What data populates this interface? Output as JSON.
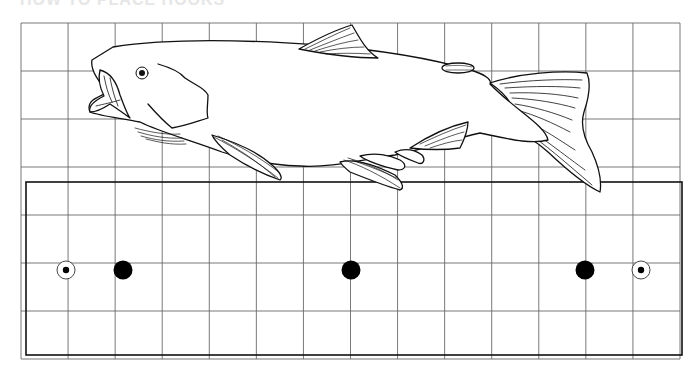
{
  "header": {
    "title": "HOW TO PLACE HOOKS"
  },
  "diagram": {
    "grid": {
      "columns": 14,
      "rows": 7
    },
    "subjects": [
      {
        "name": "fish",
        "parts": [
          "head",
          "eye",
          "mouth",
          "gill-cover",
          "dorsal-fin",
          "adipose-fin",
          "caudal-fin",
          "pectoral-fin",
          "pelvic-fin",
          "anal-fin"
        ]
      },
      {
        "name": "mounting-board"
      }
    ],
    "markers": [
      {
        "type": "ringed-dot",
        "label": "hole"
      },
      {
        "type": "solid-dot",
        "label": "peg"
      },
      {
        "type": "solid-dot",
        "label": "peg"
      },
      {
        "type": "solid-dot",
        "label": "peg"
      },
      {
        "type": "ringed-dot",
        "label": "hole"
      }
    ],
    "colors": {
      "line": "#111111",
      "grid": "#555555",
      "background": "#ffffff"
    }
  }
}
